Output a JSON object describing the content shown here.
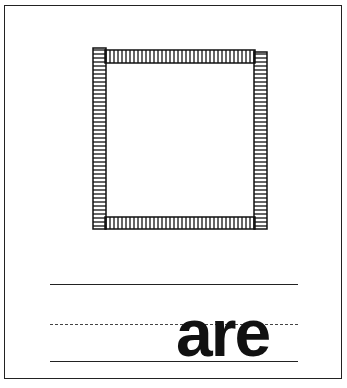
{
  "worksheet": {
    "shape": "square",
    "shape_icon": "hatched-square-icon",
    "word": "are",
    "writing_lines": [
      "solid-top",
      "dashed-midline",
      "solid-baseline"
    ],
    "colors": {
      "ink": "#111111",
      "paper": "#ffffff"
    }
  }
}
